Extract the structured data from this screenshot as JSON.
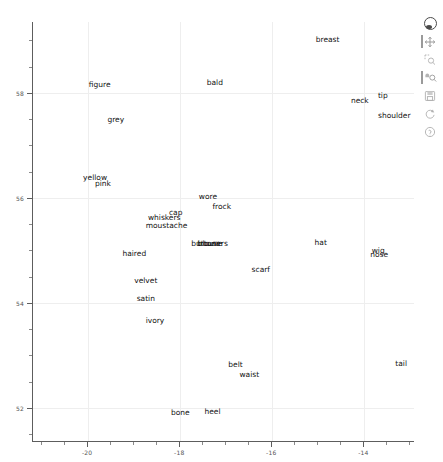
{
  "chart_data": {
    "type": "scatter",
    "title": "",
    "xlabel": "",
    "ylabel": "",
    "xlim": [
      -21.2,
      -12.9
    ],
    "ylim": [
      51.35,
      59.35
    ],
    "xticks": [
      -20,
      -18,
      -16,
      -14
    ],
    "yticks": [
      58,
      56,
      54,
      52
    ],
    "xtick_labels": [
      "-20",
      "-18",
      "-16",
      "-14"
    ],
    "ytick_labels": [
      "58",
      "56",
      "54",
      "52"
    ],
    "grid": true,
    "legend": null,
    "marker": "text-only",
    "points": [
      {
        "label": "breast",
        "x": -14.8,
        "y": 59.0
      },
      {
        "label": "figure",
        "x": -19.75,
        "y": 58.15
      },
      {
        "label": "bald",
        "x": -17.25,
        "y": 58.18
      },
      {
        "label": "tip",
        "x": -13.6,
        "y": 57.94
      },
      {
        "label": "neck",
        "x": -14.1,
        "y": 57.84
      },
      {
        "label": "shoulder",
        "x": -13.35,
        "y": 57.57
      },
      {
        "label": "grey",
        "x": -19.4,
        "y": 57.48
      },
      {
        "label": "yellow",
        "x": -19.85,
        "y": 56.38
      },
      {
        "label": "pink",
        "x": -19.68,
        "y": 56.26
      },
      {
        "label": "wore",
        "x": -17.4,
        "y": 56.02
      },
      {
        "label": "frock",
        "x": -17.1,
        "y": 55.82
      },
      {
        "label": "cap",
        "x": -18.1,
        "y": 55.72
      },
      {
        "label": "whiskers",
        "x": -18.35,
        "y": 55.62
      },
      {
        "label": "moustache",
        "x": -18.3,
        "y": 55.46
      },
      {
        "label": "buttons",
        "x": -17.45,
        "y": 55.12
      },
      {
        "label": "blouse",
        "x": -17.35,
        "y": 55.12
      },
      {
        "label": "trousers",
        "x": -17.3,
        "y": 55.12
      },
      {
        "label": "hat",
        "x": -14.95,
        "y": 55.14
      },
      {
        "label": "wig",
        "x": -13.7,
        "y": 54.99
      },
      {
        "label": "nose",
        "x": -13.68,
        "y": 54.92
      },
      {
        "label": "haired",
        "x": -19.0,
        "y": 54.93
      },
      {
        "label": "scarf",
        "x": -16.25,
        "y": 54.62
      },
      {
        "label": "velvet",
        "x": -18.75,
        "y": 54.42
      },
      {
        "label": "satin",
        "x": -18.75,
        "y": 54.08
      },
      {
        "label": "ivory",
        "x": -18.55,
        "y": 53.66
      },
      {
        "label": "belt",
        "x": -16.8,
        "y": 52.82
      },
      {
        "label": "tail",
        "x": -13.2,
        "y": 52.83
      },
      {
        "label": "waist",
        "x": -16.5,
        "y": 52.62
      },
      {
        "label": "bone",
        "x": -18.0,
        "y": 51.9
      },
      {
        "label": "heel",
        "x": -17.3,
        "y": 51.93
      }
    ]
  },
  "toolbar": {
    "items": [
      {
        "name": "bokeh-logo",
        "label": "Bokeh",
        "active": false
      },
      {
        "name": "pan-tool",
        "label": "Pan",
        "active": true
      },
      {
        "name": "box-zoom-tool",
        "label": "Box Zoom",
        "active": false
      },
      {
        "name": "wheel-zoom-tool",
        "label": "Wheel Zoom",
        "active": true
      },
      {
        "name": "save-tool",
        "label": "Save",
        "active": false
      },
      {
        "name": "reset-tool",
        "label": "Reset",
        "active": false
      },
      {
        "name": "help-tool",
        "label": "Help",
        "active": false
      }
    ]
  },
  "colors": {
    "background": "#ffffff",
    "axis": "#5d5d5d",
    "grid": "#eeeeee",
    "text": "#111111",
    "tick_label": "#555555",
    "toolbar_icon": "#9a9a9a"
  }
}
